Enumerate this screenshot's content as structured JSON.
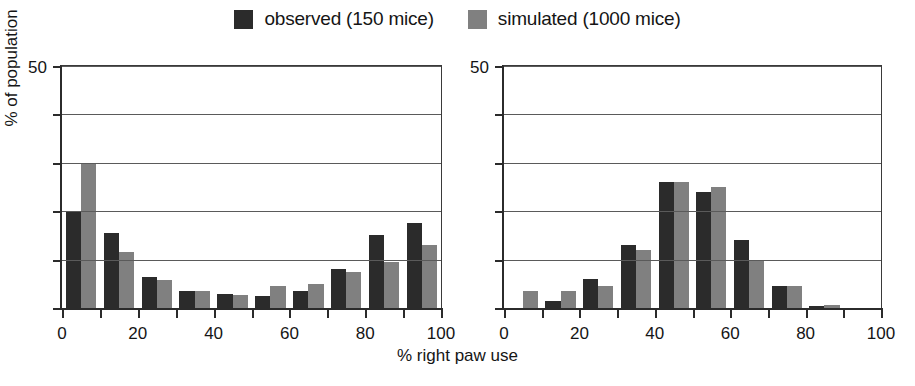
{
  "legend": {
    "entries": [
      {
        "label": "observed (150 mice)",
        "color": "#2b2b2b",
        "key": "observed"
      },
      {
        "label": "simulated (1000 mice)",
        "color": "#808080",
        "key": "simulated"
      }
    ]
  },
  "axis_label_x": "% right paw use",
  "axis_label_y": "% of population",
  "chart_data": [
    {
      "type": "bar",
      "title": "",
      "panel": "left",
      "xlabel": "% right paw use",
      "ylabel": "% of population",
      "xlim": [
        0,
        100
      ],
      "ylim": [
        0,
        50
      ],
      "grid": true,
      "legend_position": "top-center",
      "xticks": [
        0,
        10,
        20,
        30,
        40,
        50,
        60,
        70,
        80,
        90,
        100
      ],
      "xtick_labels": [
        "0",
        "",
        "20",
        "",
        "40",
        "",
        "60",
        "",
        "80",
        "",
        "100"
      ],
      "yticks": [
        0,
        10,
        20,
        30,
        40,
        50
      ],
      "ytick_labels": [
        "0",
        "",
        "",
        "",
        "",
        "50"
      ],
      "categories": [
        "0-10",
        "10-20",
        "20-30",
        "30-40",
        "40-50",
        "50-60",
        "60-70",
        "70-80",
        "80-90",
        "90-100"
      ],
      "bin_centers": [
        5,
        15,
        25,
        35,
        45,
        55,
        65,
        75,
        85,
        95
      ],
      "series": [
        {
          "name": "observed (150 mice)",
          "color": "#2b2b2b",
          "values": [
            20.0,
            15.5,
            6.5,
            3.5,
            2.8,
            2.5,
            3.5,
            8.0,
            15.0,
            17.5
          ]
        },
        {
          "name": "simulated (1000 mice)",
          "color": "#808080",
          "values": [
            30.0,
            11.5,
            5.8,
            3.5,
            2.6,
            4.5,
            5.0,
            7.5,
            9.5,
            13.0
          ]
        }
      ]
    },
    {
      "type": "bar",
      "title": "",
      "panel": "right",
      "xlabel": "% right paw use",
      "ylabel": "% of population",
      "xlim": [
        0,
        100
      ],
      "ylim": [
        0,
        50
      ],
      "grid": true,
      "legend_position": "top-center",
      "xticks": [
        0,
        10,
        20,
        30,
        40,
        50,
        60,
        70,
        80,
        90,
        100
      ],
      "xtick_labels": [
        "0",
        "",
        "20",
        "",
        "40",
        "",
        "60",
        "",
        "80",
        "",
        "100"
      ],
      "yticks": [
        0,
        10,
        20,
        30,
        40,
        50
      ],
      "ytick_labels": [
        "0",
        "",
        "",
        "",
        "",
        "50"
      ],
      "categories": [
        "0-10",
        "10-20",
        "20-30",
        "30-40",
        "40-50",
        "50-60",
        "60-70",
        "70-80",
        "80-90",
        "90-100"
      ],
      "bin_centers": [
        5,
        15,
        25,
        35,
        45,
        55,
        65,
        75,
        85,
        95
      ],
      "series": [
        {
          "name": "observed (150 mice)",
          "color": "#2b2b2b",
          "values": [
            0.0,
            1.5,
            6.0,
            13.0,
            26.0,
            24.0,
            14.0,
            4.5,
            0.4,
            0.0
          ]
        },
        {
          "name": "simulated (1000 mice)",
          "color": "#808080",
          "values": [
            3.5,
            3.5,
            4.5,
            12.0,
            26.0,
            25.0,
            10.0,
            4.5,
            0.6,
            0.0
          ]
        }
      ]
    }
  ]
}
